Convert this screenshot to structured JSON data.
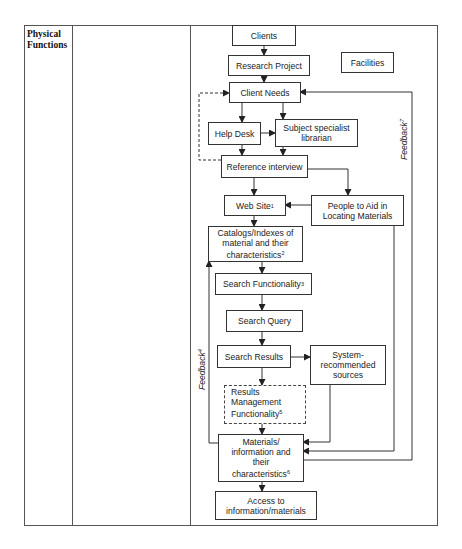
{
  "table": {
    "row_label_line1": "Physical",
    "row_label_line2": "Functions"
  },
  "nodes": {
    "clients": {
      "label": "Clients"
    },
    "research_project": {
      "label": "Research Project"
    },
    "facilities": {
      "label": "Facilities"
    },
    "client_needs": {
      "label": "Client Needs"
    },
    "help_desk": {
      "label": "Help Desk"
    },
    "subject_specialist": {
      "line1": "Subject specialist",
      "line2": "librarian"
    },
    "reference_interview": {
      "label": "Reference interview"
    },
    "web_site": {
      "label": "Web Site",
      "note": "1"
    },
    "people_to_aid": {
      "line1": "People to Aid in",
      "line2": "Locating Materials"
    },
    "catalogs": {
      "line1": "Catalogs/Indexes of",
      "line2": "material and their",
      "line3": "characteristics",
      "note": "2"
    },
    "search_functionality": {
      "label": "Search Functionality",
      "note": "3"
    },
    "search_query": {
      "label": "Search Query"
    },
    "search_results": {
      "label": "Search Results"
    },
    "system_recommended": {
      "line1": "System-",
      "line2": "recommended",
      "line3": "sources"
    },
    "results_management": {
      "line1": "Results",
      "line2": "Management",
      "line3": "Functionality",
      "note": "5",
      "style": "dashed"
    },
    "materials": {
      "line1": "Materials/",
      "line2": "information and",
      "line3": "their",
      "line4": "characteristics",
      "note": "6"
    },
    "access": {
      "line1": "Access to",
      "line2": "information/materials"
    }
  },
  "feedback_loops": {
    "feedback4": {
      "label": "Feedback",
      "note": "4"
    },
    "feedback7": {
      "label": "Feedback",
      "note": "7"
    }
  },
  "colors": {
    "line": "#333333",
    "border": "#555555",
    "background": "#ffffff"
  }
}
